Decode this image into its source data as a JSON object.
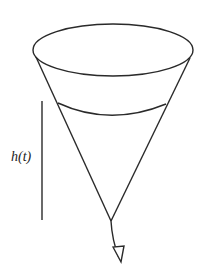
{
  "diagram": {
    "height_label": "h(t)",
    "stroke_color": "#2a2a2a"
  }
}
